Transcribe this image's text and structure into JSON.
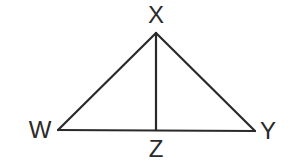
{
  "diagram": {
    "type": "triangle-with-altitude",
    "colors": {
      "background": "#ffffff",
      "stroke": "#2a2a2a",
      "label": "#2a2a2a"
    },
    "points": {
      "X": {
        "label": "X",
        "x": 156,
        "y": 33,
        "label_x": 156,
        "label_y": 17
      },
      "W": {
        "label": "W",
        "x": 58,
        "y": 130,
        "label_x": 40,
        "label_y": 132
      },
      "Y": {
        "label": "Y",
        "x": 255,
        "y": 131,
        "label_x": 268,
        "label_y": 133
      },
      "Z": {
        "label": "Z",
        "x": 156,
        "y": 130,
        "label_x": 156,
        "label_y": 151
      }
    },
    "segments": [
      {
        "name": "WX",
        "from": "W",
        "to": "X"
      },
      {
        "name": "XY",
        "from": "X",
        "to": "Y"
      },
      {
        "name": "WY",
        "from": "W",
        "to": "Y"
      },
      {
        "name": "XZ",
        "from": "X",
        "to": "Z"
      }
    ]
  }
}
